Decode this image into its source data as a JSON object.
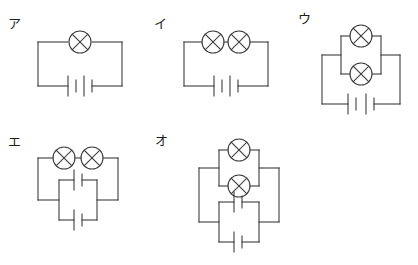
{
  "page": {
    "kind": "science-worksheet-circuit-diagrams",
    "top_cropped_text": "　　　　　　　　　　　　　　",
    "ink_color": "#3d3d3d",
    "background_color": "#ffffff"
  },
  "choices": [
    {
      "id": "a",
      "label": "ア",
      "lamps": {
        "count": 1,
        "arrangement": "single"
      },
      "cells": {
        "count": 2,
        "arrangement": "series"
      }
    },
    {
      "id": "i",
      "label": "イ",
      "lamps": {
        "count": 2,
        "arrangement": "series"
      },
      "cells": {
        "count": 2,
        "arrangement": "series"
      }
    },
    {
      "id": "u",
      "label": "ウ",
      "lamps": {
        "count": 2,
        "arrangement": "parallel"
      },
      "cells": {
        "count": 2,
        "arrangement": "series"
      }
    },
    {
      "id": "e",
      "label": "エ",
      "lamps": {
        "count": 2,
        "arrangement": "series"
      },
      "cells": {
        "count": 2,
        "arrangement": "parallel"
      }
    },
    {
      "id": "o",
      "label": "オ",
      "lamps": {
        "count": 2,
        "arrangement": "parallel"
      },
      "cells": {
        "count": 2,
        "arrangement": "parallel"
      }
    }
  ]
}
